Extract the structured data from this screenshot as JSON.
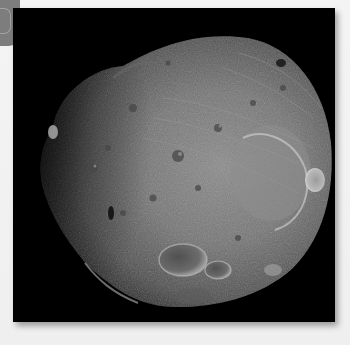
{
  "page": {
    "background_color": "#f2f2f2"
  },
  "tab_handle": {
    "color": "#7d7d7d"
  },
  "photo": {
    "subject": "Phobos (moon of Mars)",
    "alt": "Grayscale photograph of a cratered, irregularly shaped moon against a black background",
    "frame_color": "#000000",
    "surface_color": "#6e6e6e",
    "highlight_color": "#bdbdbd"
  }
}
